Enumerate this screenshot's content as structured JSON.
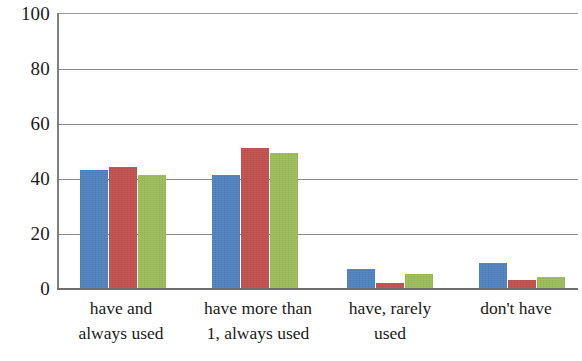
{
  "chart_data": {
    "type": "bar",
    "title": "",
    "subtitle": "",
    "xlabel": "",
    "ylabel": "",
    "ylim": [
      0,
      100
    ],
    "yticks": [
      0,
      20,
      40,
      60,
      80,
      100
    ],
    "grid": true,
    "legend": "none",
    "categories": [
      "have and always used",
      "have more than 1, always used",
      "have, rarely used",
      "don't have"
    ],
    "category_lines": [
      [
        "have and",
        "always used"
      ],
      [
        "have more than",
        "1, always used"
      ],
      [
        "have, rarely",
        "used"
      ],
      [
        "don't have",
        ""
      ]
    ],
    "series": [
      {
        "name": "Series 1",
        "color": "#4f81bd",
        "values": [
          43,
          41,
          7,
          9
        ]
      },
      {
        "name": "Series 2",
        "color": "#c0504d",
        "values": [
          44,
          51,
          2,
          3
        ]
      },
      {
        "name": "Series 3",
        "color": "#9bbb59",
        "values": [
          41,
          49,
          5,
          4
        ]
      }
    ]
  },
  "axis": {
    "y_tick_labels": [
      "100",
      "80",
      "60",
      "40",
      "20",
      "0"
    ]
  }
}
